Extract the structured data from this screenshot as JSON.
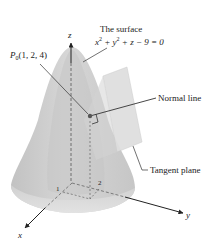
{
  "figure": {
    "type": "3d-surface-diagram",
    "colors": {
      "surface": "#cdcdcd",
      "surface_dark": "#bdbdbd",
      "surface_light": "#e2e2e2",
      "plane": "#d9d9d9",
      "line": "#333333",
      "point": "#555555"
    },
    "axes": {
      "x_label": "x",
      "y_label": "y",
      "z_label": "z",
      "tick_x": "1",
      "tick_y": "2"
    },
    "surface_label": {
      "line1": "The surface",
      "equation_parts": [
        "x",
        "2",
        " + y",
        "2",
        " + z − 9 = 0"
      ]
    },
    "point_label": {
      "name": "P",
      "subscript": "0",
      "coords": "(1, 2, 4)"
    },
    "normal_line_label": "Normal line",
    "tangent_plane_label": "Tangent plane"
  }
}
